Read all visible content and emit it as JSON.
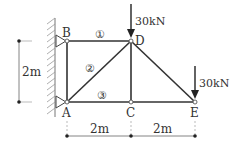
{
  "diagram": {
    "type": "truss",
    "nodes": [
      {
        "id": "A",
        "label": "A",
        "x": 67,
        "y": 102
      },
      {
        "id": "B",
        "label": "B",
        "x": 67,
        "y": 41
      },
      {
        "id": "C",
        "label": "C",
        "x": 131,
        "y": 102
      },
      {
        "id": "D",
        "label": "D",
        "x": 131,
        "y": 41
      },
      {
        "id": "E",
        "label": "E",
        "x": 195,
        "y": 102
      }
    ],
    "members": [
      {
        "from": "B",
        "to": "D",
        "label": "①"
      },
      {
        "from": "A",
        "to": "D",
        "label": "②"
      },
      {
        "from": "A",
        "to": "C",
        "label": "③"
      },
      {
        "from": "A",
        "to": "B",
        "label": ""
      },
      {
        "from": "C",
        "to": "E",
        "label": ""
      },
      {
        "from": "C",
        "to": "D",
        "label": ""
      },
      {
        "from": "D",
        "to": "E",
        "label": ""
      }
    ],
    "member_labels": {
      "m1": "①",
      "m2": "②",
      "m3": "③"
    },
    "supports": [
      {
        "node": "B",
        "type": "pin-to-wall"
      },
      {
        "node": "A",
        "type": "pin-to-wall"
      }
    ],
    "loads": [
      {
        "node": "D",
        "label": "30kN",
        "direction": "down"
      },
      {
        "node": "E",
        "label": "30kN",
        "direction": "down"
      }
    ],
    "dimensions": {
      "vertical": {
        "label": "2m"
      },
      "horizontal": [
        {
          "label": "2m"
        },
        {
          "label": "2m"
        }
      ]
    },
    "colors": {
      "member": "#333333",
      "wall_hatch": "#888888",
      "dimension": "#555555"
    }
  }
}
